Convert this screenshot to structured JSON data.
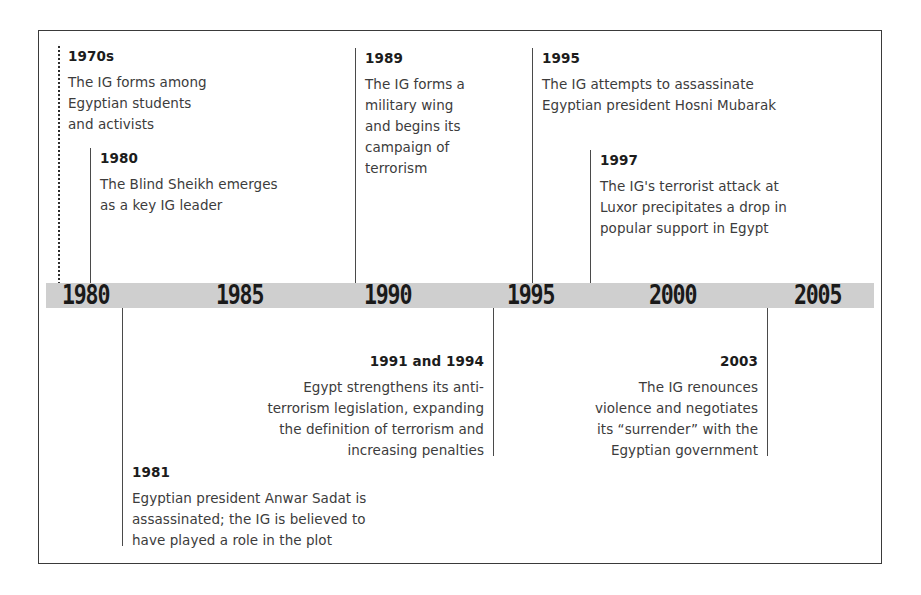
{
  "figure": {
    "type": "timeline",
    "orientation": "horizontal",
    "axis": {
      "label": "years",
      "ticks": [
        "1980",
        "1985",
        "1990",
        "1995",
        "2000",
        "2005"
      ],
      "range": [
        "1980",
        "2005"
      ],
      "band_color": "#cfcfcf",
      "text_color": "#1a1a1a"
    },
    "events_above": [
      {
        "year": "1970s",
        "text": "The IG forms among\nEgyptian students\nand activists",
        "connector": "dotted"
      },
      {
        "year": "1980",
        "text": "The Blind Sheikh emerges\nas a key IG leader",
        "connector": "solid"
      },
      {
        "year": "1989",
        "text": "The IG forms a\nmilitary wing\nand begins its\ncampaign of\nterrorism",
        "connector": "solid"
      },
      {
        "year": "1995",
        "text": "The IG attempts to assassinate\nEgyptian president Hosni Mubarak",
        "connector": "solid"
      },
      {
        "year": "1997",
        "text": "The IG's terrorist attack at\nLuxor precipitates a drop in\npopular support in Egypt",
        "connector": "solid"
      }
    ],
    "events_below": [
      {
        "year": "1991 and 1994",
        "text": "Egypt strengthens its anti-\nterrorism legislation, expanding\nthe definition of terrorism and\nincreasing penalties",
        "connector": "solid"
      },
      {
        "year": "2003",
        "text": "The IG renounces\nviolence and negotiates\nits “surrender” with the\nEgyptian government",
        "connector": "solid"
      },
      {
        "year": "1981",
        "text": "Egyptian president Anwar Sadat is\nassassinated; the IG is believed to\nhave played a role in the plot",
        "connector": "solid"
      }
    ]
  }
}
